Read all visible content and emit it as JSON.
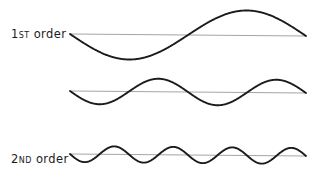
{
  "figure": {
    "background_color": "#ffffff",
    "width": 319,
    "height": 176
  },
  "style": {
    "curve_color": "#1b1b1b",
    "baseline_color": "#9a9a9a",
    "label_color": "#1b1b1b",
    "curve_stroke_width": 1.9,
    "baseline_stroke_width": 0.9
  },
  "rows": [
    {
      "id": "first-order",
      "label_number": "1",
      "label_suffix": "ST",
      "label_word": "order",
      "label_full": "1ST order"
    },
    {
      "id": "second-order",
      "label_number": "2",
      "label_suffix": "ND",
      "label_word": "order",
      "label_full": "2ND order"
    },
    {
      "id": "third-order",
      "label_number": "3",
      "label_suffix": "RD",
      "label_word": "order",
      "label_full": "3RD order"
    }
  ],
  "chart_data": {
    "type": "line",
    "xlabel": "",
    "ylabel": "",
    "grid": false,
    "legend": "none",
    "x_domain": [
      0,
      1
    ],
    "x_pixel_range": [
      70,
      306
    ],
    "series": [
      {
        "name": "1ST order",
        "harmonic": 1,
        "cycles": 1,
        "amplitude_px": 25,
        "baseline_y_px": 35,
        "phase": "negative-first",
        "formula": "y = -A * sin(2*pi*1*x)",
        "peak_y_px": 10,
        "trough_y_px": 62,
        "samples_x": [
          0,
          0.125,
          0.25,
          0.375,
          0.5,
          0.625,
          0.75,
          0.875,
          1
        ],
        "samples_y": [
          0,
          -0.707,
          -1,
          -0.707,
          0,
          0.707,
          1,
          0.707,
          0
        ]
      },
      {
        "name": "2ND order",
        "harmonic": 2,
        "cycles": 2,
        "amplitude_px": 13,
        "baseline_y_px": 22,
        "phase": "negative-first",
        "formula": "y = -A * sin(2*pi*2*x)",
        "samples_x": [
          0,
          0.125,
          0.25,
          0.375,
          0.5,
          0.625,
          0.75,
          0.875,
          1
        ],
        "samples_y": [
          0,
          -1,
          0,
          1,
          0,
          -1,
          0,
          1,
          0
        ]
      },
      {
        "name": "3RD order",
        "harmonic": 3,
        "cycles": 4,
        "amplitude_px": 8,
        "baseline_y_px": 30,
        "phase": "negative-first",
        "formula": "y = -A * sin(2*pi*4*x)",
        "samples_x": [
          0,
          0.0625,
          0.125,
          0.1875,
          0.25,
          0.3125,
          0.375,
          0.4375,
          0.5,
          0.5625,
          0.625,
          0.6875,
          0.75,
          0.8125,
          0.875,
          0.9375,
          1
        ],
        "samples_y": [
          0,
          -1,
          0,
          1,
          0,
          -1,
          0,
          1,
          0,
          -1,
          0,
          1,
          0,
          -1,
          0,
          1,
          0
        ]
      }
    ]
  }
}
